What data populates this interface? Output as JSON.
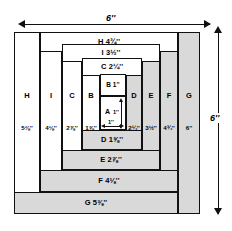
{
  "diagram": {
    "overall_width_label": "6''",
    "overall_height_label": "6''",
    "colors": {
      "shaded": "#d9d9d9",
      "unshaded": "#ffffff",
      "line": "#111111"
    },
    "center": {
      "letter": "A",
      "width_label": "1''",
      "height_label": "1''",
      "fill": "stipple"
    },
    "top_strips": [
      {
        "letter": "H",
        "measure": "4¾''"
      },
      {
        "letter": "I",
        "measure": "3½''"
      },
      {
        "letter": "C",
        "measure": "2¼''"
      },
      {
        "letter": "B",
        "measure": "1''"
      }
    ],
    "bottom_strips": [
      {
        "letter": "D",
        "measure": "1⅝''"
      },
      {
        "letter": "E",
        "measure": "2⅞''"
      },
      {
        "letter": "F",
        "measure": "4⅛''"
      },
      {
        "letter": "G",
        "measure": "5⅜''"
      }
    ],
    "left_columns": [
      {
        "letter": "H",
        "measure": "5⅜''"
      },
      {
        "letter": "I",
        "measure": "4⅛''"
      },
      {
        "letter": "C",
        "measure": "2⅞''"
      },
      {
        "letter": "B",
        "measure": "1⅝''"
      }
    ],
    "right_columns": [
      {
        "letter": "D",
        "measure": "2¼''"
      },
      {
        "letter": "E",
        "measure": "3½''"
      },
      {
        "letter": "F",
        "measure": "4¾''"
      },
      {
        "letter": "G",
        "measure": "6''"
      }
    ]
  }
}
